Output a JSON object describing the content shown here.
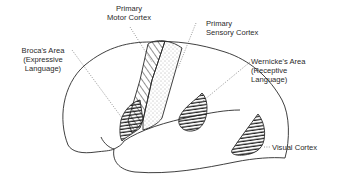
{
  "diagram": {
    "type": "brain-lateral-view",
    "labels": {
      "motor": {
        "line1": "Primary",
        "line2": "Motor Cortex"
      },
      "sensory": {
        "line1": "Primary",
        "line2": "Sensory Cortex"
      },
      "broca": {
        "line1": "Broca's Area",
        "line2": "(Expressive",
        "line3": "Language)"
      },
      "wernicke": {
        "line1": "Wernicke's Area",
        "line2": "(Receptive",
        "line3": "Language)"
      },
      "visual": {
        "line1": "Visual Cortex"
      }
    },
    "colors": {
      "stroke": "#2a2a2a",
      "background": "#ffffff"
    }
  }
}
